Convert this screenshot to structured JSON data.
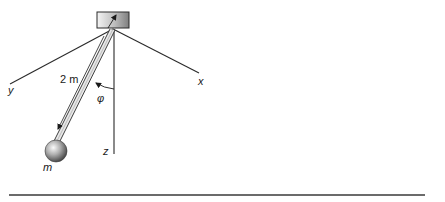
{
  "diagram": {
    "type": "pendulum-coordinate-diagram",
    "labels": {
      "x_axis": "x",
      "y_axis": "y",
      "z_axis": "z",
      "length": "2 m",
      "angle": "φ",
      "mass": "m"
    },
    "colors": {
      "line": "#2a2a2a",
      "rule": "#6b6b6b",
      "block_light": "#f2f2f2",
      "block_dark": "#8a8a8a",
      "ball_light": "#f5f5f5",
      "ball_dark": "#4a4a4a"
    }
  }
}
